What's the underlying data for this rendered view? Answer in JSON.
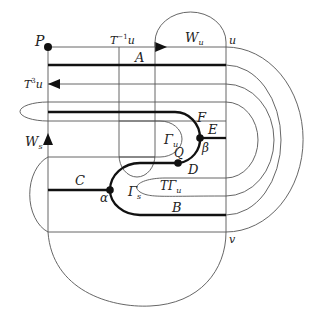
{
  "diagram": {
    "labels": {
      "P": "P",
      "T_inv_u": "T",
      "T_inv_u_sup": "−1",
      "T_inv_u_tail": "u",
      "W_u": "W",
      "W_u_sub": "u",
      "u": "u",
      "A": "A",
      "T3u": "T",
      "T3u_sup": "3",
      "T3u_tail": "u",
      "F": "F",
      "E": "E",
      "Gamma_u": "Γ",
      "Gamma_u_sub": "u",
      "beta": "β",
      "Q": "Q",
      "D": "D",
      "W_s": "W",
      "W_s_sub": "s",
      "C": "C",
      "alpha": "α",
      "Gamma_s": "Γ",
      "Gamma_s_sub": "s",
      "TGamma_u": "TΓ",
      "TGamma_u_sub": "u",
      "B": "B",
      "v": "v"
    }
  }
}
